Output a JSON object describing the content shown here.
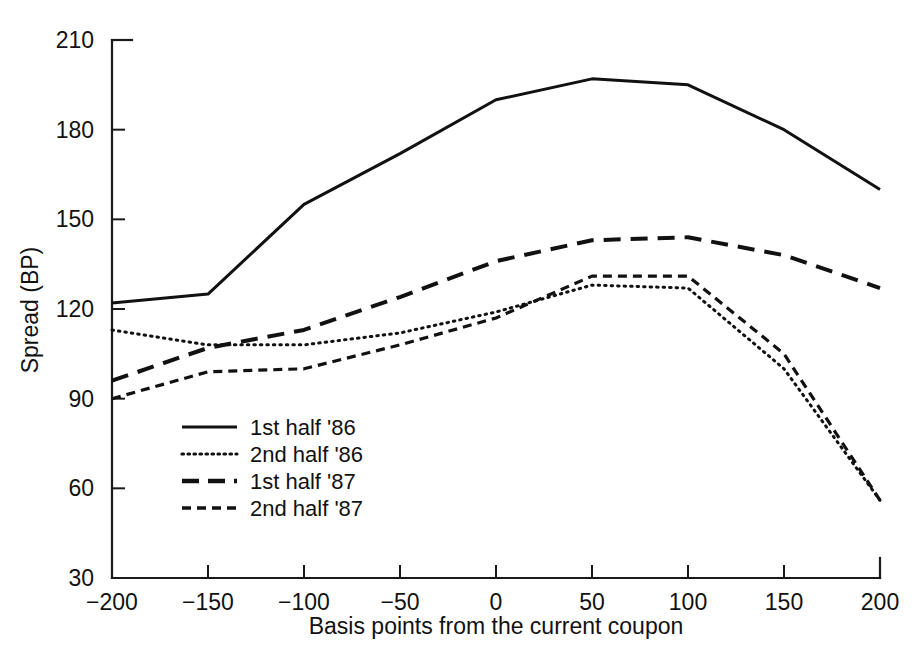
{
  "chart_data": {
    "type": "line",
    "title": "",
    "xlabel": "Basis points from the current coupon",
    "ylabel": "Spread (BP)",
    "xlim": [
      -200,
      200
    ],
    "ylim": [
      30,
      210
    ],
    "xticks": [
      -200,
      -150,
      -100,
      -50,
      0,
      50,
      100,
      150,
      200
    ],
    "xtick_labels": [
      "−200",
      "−150",
      "−100",
      "−50",
      "0",
      "50",
      "100",
      "150",
      "200"
    ],
    "yticks": [
      30,
      60,
      90,
      120,
      150,
      180,
      210
    ],
    "ytick_labels": [
      "30",
      "60",
      "90",
      "120",
      "150",
      "180",
      "210"
    ],
    "grid": false,
    "legend_position": "inside-lower-left",
    "x": [
      -200,
      -150,
      -100,
      -50,
      0,
      50,
      100,
      150,
      200
    ],
    "series": [
      {
        "name": "1st half '86",
        "style": "solid",
        "values": [
          122,
          125,
          155,
          172,
          190,
          197,
          195,
          180,
          160
        ]
      },
      {
        "name": "2nd half '86",
        "style": "dotted",
        "values": [
          113,
          108,
          108,
          112,
          119,
          128,
          127,
          100,
          56
        ]
      },
      {
        "name": "1st half '87",
        "style": "long-dash",
        "values": [
          96,
          107,
          113,
          124,
          136,
          143,
          144,
          138,
          127
        ]
      },
      {
        "name": "2nd half '87",
        "style": "short-dash",
        "values": [
          90,
          99,
          100,
          108,
          117,
          131,
          131,
          105,
          56
        ]
      }
    ]
  },
  "legend": {
    "items": [
      {
        "label": "1st half '86",
        "style": "solid"
      },
      {
        "label": "2nd half '86",
        "style": "dotted"
      },
      {
        "label": "1st half '87",
        "style": "long-dash"
      },
      {
        "label": "2nd half '87",
        "style": "short-dash"
      }
    ]
  },
  "colors": {
    "ink": "#111111",
    "background": "#ffffff"
  }
}
